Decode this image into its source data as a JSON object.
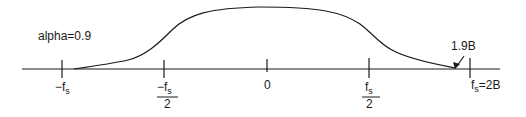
{
  "diagram": {
    "type": "raised-cosine-spectrum",
    "annotation": "alpha=0.9",
    "arrow_label": "1.9B",
    "axis_ticks": [
      {
        "id": "neg-fs",
        "numerator": "−f",
        "sub": "s",
        "denominator": ""
      },
      {
        "id": "neg-fs-half",
        "numerator": "−f",
        "sub": "s",
        "denominator": "2"
      },
      {
        "id": "zero",
        "numerator": "0",
        "sub": "",
        "denominator": ""
      },
      {
        "id": "fs-half",
        "numerator": "f",
        "sub": "s",
        "denominator": "2"
      },
      {
        "id": "fs",
        "numerator": "f",
        "sub": "s",
        "suffix": "=2B",
        "denominator": ""
      }
    ],
    "stroke_color": "#1a1a1a"
  }
}
